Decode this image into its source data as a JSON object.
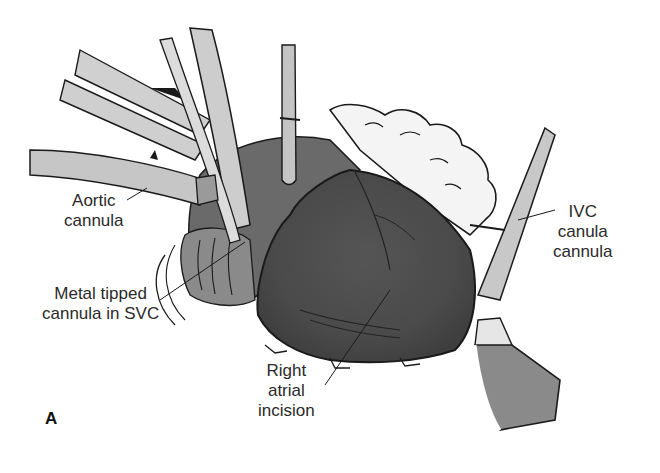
{
  "figure": {
    "panel_letter": "A",
    "labels": {
      "aortic_cannula": {
        "line1": "Aortic",
        "line2": "cannula"
      },
      "metal_tipped": {
        "line1": "Metal tipped",
        "line2": "cannula in SVC"
      },
      "right_atrial": {
        "line1": "Right",
        "line2": "atrial",
        "line3": "incision"
      },
      "ivc": {
        "line1": "IVC",
        "line2": "canula",
        "line3": "cannula"
      }
    },
    "colors": {
      "ink": "#1a1a1a",
      "heart_dark": "#4a4a4a",
      "heart_mid": "#6e6e6e",
      "tube_light": "#c8c8c8",
      "tissue": "#f2f2f2",
      "shadow": "#9a9a9a"
    }
  }
}
